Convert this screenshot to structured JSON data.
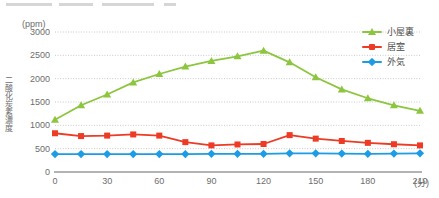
{
  "chart_data": {
    "type": "line",
    "title": "",
    "xlabel": "(分)",
    "ylabel": "二酸化炭素濃度",
    "unit_label": "(ppm)",
    "x": [
      0,
      15,
      30,
      45,
      60,
      75,
      90,
      105,
      120,
      135,
      150,
      165,
      180,
      195,
      210
    ],
    "xlim": [
      0,
      210
    ],
    "ylim": [
      0,
      3000
    ],
    "xticks": [
      "0",
      "30",
      "60",
      "90",
      "120",
      "150",
      "180",
      "210"
    ],
    "xtick_values": [
      0,
      30,
      60,
      90,
      120,
      150,
      180,
      210
    ],
    "yticks": [
      "0",
      "500",
      "1000",
      "1500",
      "2000",
      "2500",
      "3000"
    ],
    "ytick_values": [
      0,
      500,
      1000,
      1500,
      2000,
      2500,
      3000
    ],
    "grid": true,
    "legend_position": "top-right",
    "series": [
      {
        "name": "小屋裏",
        "color": "#8CC63F",
        "marker": "triangle",
        "values": [
          1120,
          1430,
          1660,
          1920,
          2100,
          2260,
          2380,
          2480,
          2600,
          2350,
          2030,
          1770,
          1580,
          1430,
          1310
        ]
      },
      {
        "name": "居室",
        "color": "#ED3B25",
        "marker": "square",
        "values": [
          830,
          770,
          780,
          805,
          780,
          640,
          570,
          590,
          600,
          790,
          715,
          665,
          625,
          595,
          570
        ]
      },
      {
        "name": "外気",
        "color": "#1B9CE5",
        "marker": "diamond",
        "values": [
          385,
          385,
          385,
          385,
          385,
          385,
          390,
          390,
          390,
          400,
          400,
          395,
          390,
          395,
          400
        ]
      }
    ]
  },
  "legend": {
    "items": [
      {
        "label": "小屋裏",
        "color": "#8CC63F"
      },
      {
        "label": "居室",
        "color": "#ED3B25"
      },
      {
        "label": "外気",
        "color": "#1B9CE5"
      }
    ]
  },
  "axes": {
    "unit_label": "(ppm)",
    "y_title": "二酸化炭素濃度",
    "x_unit": "(分)"
  }
}
